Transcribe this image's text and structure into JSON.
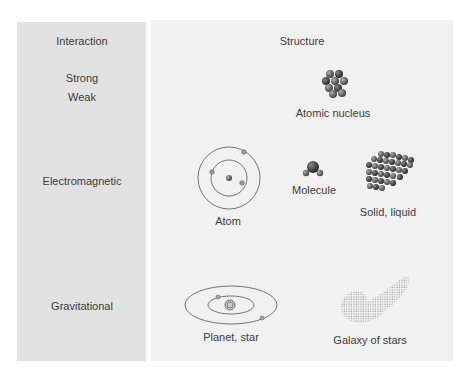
{
  "headers": {
    "interaction": "Interaction",
    "structure": "Structure"
  },
  "interactions": [
    {
      "label": "Strong"
    },
    {
      "label": "Weak"
    },
    {
      "label": "Electromagnetic"
    },
    {
      "label": "Gravitational"
    }
  ],
  "structures": [
    {
      "label": "Atomic nucleus",
      "icon": "nucleus-icon"
    },
    {
      "label": "Atom",
      "icon": "atom-icon"
    },
    {
      "label": "Molecule",
      "icon": "molecule-icon"
    },
    {
      "label": "Solid, liquid",
      "icon": "lattice-icon"
    },
    {
      "label": "Planet, star",
      "icon": "solar-system-icon"
    },
    {
      "label": "Galaxy of stars",
      "icon": "galaxy-icon"
    }
  ],
  "colors": {
    "left_panel": "#e2e2e2",
    "right_panel": "#f1f1f1",
    "text": "#3c3c3c",
    "particle": "#6e6e6e"
  }
}
